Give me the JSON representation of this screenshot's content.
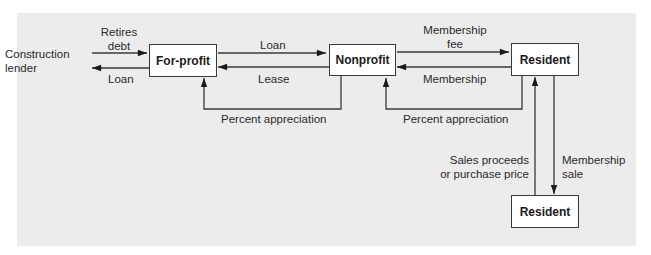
{
  "diagram": {
    "nodes": {
      "construction_lender": "Construction\nlender",
      "for_profit": "For-profit",
      "nonprofit": "Nonprofit",
      "resident_top": "Resident",
      "resident_bottom": "Resident"
    },
    "edges": {
      "retires_debt": "Retires\ndebt",
      "loan_to_lender": "Loan",
      "loan_to_nonprofit": "Loan",
      "lease": "Lease",
      "percent_appreciation_1": "Percent appreciation",
      "membership_fee": "Membership\nfee",
      "membership": "Membership",
      "percent_appreciation_2": "Percent appreciation",
      "sales_proceeds": "Sales proceeds\nor purchase price",
      "membership_sale": "Membership\nsale"
    },
    "colors": {
      "panel": "#ececec",
      "line": "#3a3a3a",
      "box": "#ffffff"
    }
  }
}
